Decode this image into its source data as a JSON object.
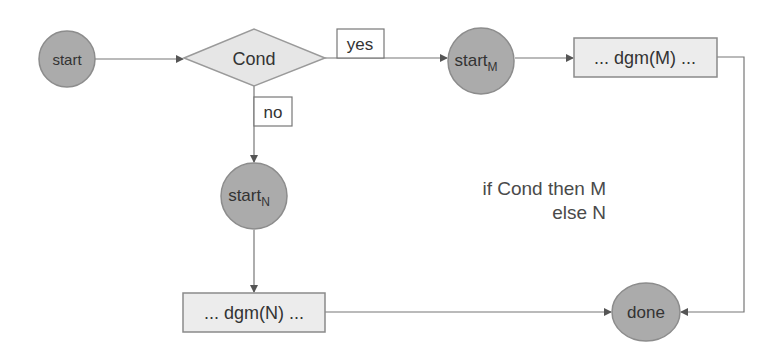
{
  "diagram": {
    "type": "flowchart",
    "colors": {
      "circle_fill": "#ababab",
      "circle_stroke": "#8c8c8c",
      "box_fill": "#ececec",
      "box_stroke": "#8a8a8a",
      "diamond_fill": "#e6e6e6",
      "diamond_stroke": "#9a9a9a",
      "edge": "#777777",
      "text": "#333333"
    },
    "nodes": {
      "start": {
        "label": "start",
        "shape": "circle"
      },
      "cond": {
        "label": "Cond",
        "shape": "diamond"
      },
      "start_m": {
        "label": "start",
        "subscript": "M",
        "shape": "circle"
      },
      "dgm_m": {
        "label": "... dgm(M) ...",
        "shape": "box"
      },
      "start_n": {
        "label": "start",
        "subscript": "N",
        "shape": "circle"
      },
      "dgm_n": {
        "label": "... dgm(N) ...",
        "shape": "box"
      },
      "done": {
        "label": "done",
        "shape": "circle"
      }
    },
    "edge_labels": {
      "yes": "yes",
      "no": "no"
    },
    "edges": [
      {
        "from": "start",
        "to": "cond"
      },
      {
        "from": "cond",
        "to": "start_m",
        "label": "yes"
      },
      {
        "from": "start_m",
        "to": "dgm_m"
      },
      {
        "from": "dgm_m",
        "to": "done"
      },
      {
        "from": "cond",
        "to": "start_n",
        "label": "no"
      },
      {
        "from": "start_n",
        "to": "dgm_n"
      },
      {
        "from": "dgm_n",
        "to": "done"
      }
    ],
    "caption": {
      "line1": "if Cond then M",
      "line2": "else N"
    }
  }
}
